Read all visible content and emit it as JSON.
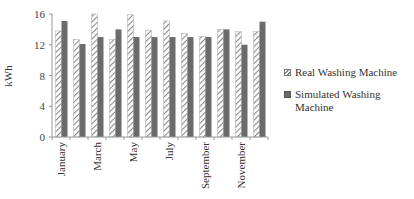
{
  "chart_data": {
    "type": "bar",
    "title": "",
    "xlabel": "",
    "ylabel": "kWh",
    "ylim": [
      0,
      16
    ],
    "yticks": [
      0,
      4,
      8,
      12,
      16
    ],
    "grid": false,
    "legend_position": "right",
    "categories": [
      "January",
      "February",
      "March",
      "April",
      "May",
      "June",
      "July",
      "August",
      "September",
      "October",
      "November",
      "December"
    ],
    "visible_category_labels": [
      "January",
      "March",
      "May",
      "July",
      "September",
      "November"
    ],
    "series": [
      {
        "name": "Real Washing Machine",
        "style": "diagonal-hatch",
        "values": [
          13.8,
          12.7,
          16.0,
          12.7,
          15.9,
          13.9,
          15.1,
          13.5,
          13.1,
          14.0,
          13.7,
          13.7
        ]
      },
      {
        "name": "Simulated Washing Machine",
        "style": "solid-gray",
        "values": [
          15.1,
          12.1,
          13.0,
          14.0,
          13.0,
          13.0,
          13.0,
          13.0,
          13.0,
          14.0,
          12.0,
          15.0
        ]
      }
    ]
  },
  "legend": {
    "real_label": "Real Washing Machine",
    "sim_label_line1": "Simulated Washing",
    "sim_label_line2": "Machine"
  },
  "colors": {
    "simulated_fill": "#6b6b6b",
    "hatch_stroke": "#888888",
    "axis": "#999999"
  }
}
